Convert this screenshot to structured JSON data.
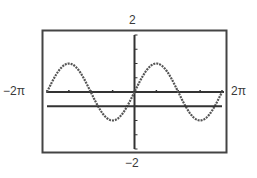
{
  "chart_data": {
    "type": "line",
    "title": "",
    "xlabel": "",
    "ylabel": "",
    "xlim": [
      -6.2832,
      6.2832
    ],
    "ylim": [
      -2,
      2
    ],
    "window_labels": {
      "xmin": "−2π",
      "xmax": "2π",
      "ymin": "−2",
      "ymax": "2"
    },
    "x_tick_spacing": "π/2",
    "y_tick_spacing": 0.5,
    "grid": false,
    "legend": null,
    "series": [
      {
        "name": "curve",
        "expression": "y = sin(x)",
        "style": "dotted",
        "color": "#555555",
        "x": [
          -6.2832,
          -4.7124,
          -3.1416,
          -1.5708,
          0,
          1.5708,
          3.1416,
          4.7124,
          6.2832
        ],
        "values": [
          0,
          1,
          0,
          -1,
          0,
          1,
          0,
          -1,
          0
        ]
      },
      {
        "name": "horizontal line",
        "expression": "y = -0.5",
        "note": "value estimated from pixel position; not labeled in the image",
        "style": "solid",
        "color": "#333333",
        "x": [
          -6.2832,
          6.2832
        ],
        "values": [
          -0.5,
          -0.5
        ]
      }
    ]
  },
  "labels": {
    "ymax": "2",
    "ymin": "−2",
    "xmin": "−2π",
    "xmax": "2π"
  }
}
